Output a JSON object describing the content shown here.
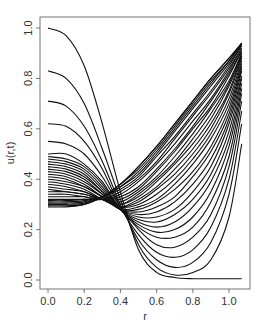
{
  "chart_data": {
    "type": "line",
    "title": "",
    "xlabel": "r",
    "ylabel": "u(r,t)",
    "xlim": [
      -0.04,
      1.12
    ],
    "ylim": [
      -0.04,
      1.04
    ],
    "x_ticks": [
      0.0,
      0.2,
      0.4,
      0.6,
      0.8,
      1.0
    ],
    "x_tick_labels": [
      "0.0",
      "0.2",
      "0.4",
      "0.6",
      "0.8",
      "1.0"
    ],
    "y_ticks": [
      0.0,
      0.2,
      0.4,
      0.6,
      0.8,
      1.0
    ],
    "y_tick_labels": [
      "0.0",
      "0.2",
      "0.4",
      "0.6",
      "0.8",
      "1.0"
    ],
    "grid": false,
    "legend": "none",
    "x": [
      0.0,
      0.1,
      0.2,
      0.3,
      0.4,
      0.5,
      0.6,
      0.7,
      0.8,
      0.9,
      1.0,
      1.07
    ],
    "series": [
      {
        "name": "t0",
        "values": [
          1.0,
          0.97,
          0.85,
          0.62,
          0.35,
          0.12,
          0.03,
          0.01,
          0.005,
          0.005,
          0.005,
          0.005
        ]
      },
      {
        "name": "t1",
        "values": [
          0.83,
          0.8,
          0.7,
          0.52,
          0.32,
          0.14,
          0.05,
          0.02,
          0.03,
          0.08,
          0.25,
          0.54
        ]
      },
      {
        "name": "t2",
        "values": [
          0.71,
          0.69,
          0.61,
          0.47,
          0.3,
          0.16,
          0.08,
          0.05,
          0.07,
          0.15,
          0.34,
          0.62
        ]
      },
      {
        "name": "t3",
        "values": [
          0.62,
          0.61,
          0.55,
          0.44,
          0.29,
          0.18,
          0.11,
          0.09,
          0.12,
          0.21,
          0.4,
          0.67
        ]
      },
      {
        "name": "t4",
        "values": [
          0.55,
          0.54,
          0.5,
          0.41,
          0.29,
          0.2,
          0.14,
          0.13,
          0.17,
          0.26,
          0.45,
          0.71
        ]
      },
      {
        "name": "t5",
        "values": [
          0.5,
          0.5,
          0.46,
          0.39,
          0.28,
          0.21,
          0.17,
          0.17,
          0.21,
          0.31,
          0.49,
          0.74
        ]
      },
      {
        "name": "t6",
        "values": [
          0.49,
          0.48,
          0.45,
          0.38,
          0.28,
          0.22,
          0.19,
          0.2,
          0.25,
          0.35,
          0.53,
          0.76
        ]
      },
      {
        "name": "t7",
        "values": [
          0.48,
          0.47,
          0.44,
          0.37,
          0.28,
          0.23,
          0.21,
          0.23,
          0.29,
          0.39,
          0.56,
          0.78
        ]
      },
      {
        "name": "t8",
        "values": [
          0.47,
          0.46,
          0.43,
          0.36,
          0.28,
          0.24,
          0.23,
          0.26,
          0.32,
          0.42,
          0.59,
          0.8
        ]
      },
      {
        "name": "t9",
        "values": [
          0.46,
          0.45,
          0.42,
          0.35,
          0.28,
          0.25,
          0.25,
          0.28,
          0.35,
          0.45,
          0.62,
          0.81
        ]
      },
      {
        "name": "t10",
        "values": [
          0.45,
          0.44,
          0.41,
          0.35,
          0.28,
          0.26,
          0.27,
          0.31,
          0.38,
          0.48,
          0.64,
          0.83
        ]
      },
      {
        "name": "t11",
        "values": [
          0.44,
          0.43,
          0.4,
          0.34,
          0.28,
          0.27,
          0.29,
          0.33,
          0.41,
          0.51,
          0.66,
          0.84
        ]
      },
      {
        "name": "t12",
        "values": [
          0.43,
          0.42,
          0.39,
          0.34,
          0.28,
          0.28,
          0.31,
          0.36,
          0.43,
          0.53,
          0.68,
          0.85
        ]
      },
      {
        "name": "t13",
        "values": [
          0.42,
          0.41,
          0.38,
          0.33,
          0.28,
          0.29,
          0.32,
          0.38,
          0.46,
          0.56,
          0.7,
          0.86
        ]
      },
      {
        "name": "t14",
        "values": [
          0.41,
          0.4,
          0.37,
          0.33,
          0.29,
          0.3,
          0.34,
          0.4,
          0.48,
          0.58,
          0.72,
          0.87
        ]
      },
      {
        "name": "t15",
        "values": [
          0.4,
          0.39,
          0.37,
          0.33,
          0.29,
          0.31,
          0.36,
          0.42,
          0.5,
          0.6,
          0.74,
          0.88
        ]
      },
      {
        "name": "t16",
        "values": [
          0.39,
          0.38,
          0.36,
          0.32,
          0.29,
          0.32,
          0.37,
          0.44,
          0.52,
          0.62,
          0.75,
          0.89
        ]
      },
      {
        "name": "t17",
        "values": [
          0.38,
          0.37,
          0.35,
          0.32,
          0.3,
          0.33,
          0.39,
          0.46,
          0.54,
          0.64,
          0.77,
          0.89
        ]
      },
      {
        "name": "t18",
        "values": [
          0.37,
          0.36,
          0.35,
          0.32,
          0.3,
          0.34,
          0.4,
          0.47,
          0.56,
          0.66,
          0.78,
          0.9
        ]
      },
      {
        "name": "t19",
        "values": [
          0.36,
          0.35,
          0.34,
          0.32,
          0.31,
          0.35,
          0.41,
          0.49,
          0.58,
          0.68,
          0.79,
          0.9
        ]
      },
      {
        "name": "t20",
        "values": [
          0.35,
          0.35,
          0.34,
          0.32,
          0.32,
          0.36,
          0.43,
          0.51,
          0.6,
          0.69,
          0.81,
          0.91
        ]
      },
      {
        "name": "t21",
        "values": [
          0.34,
          0.34,
          0.33,
          0.32,
          0.33,
          0.37,
          0.44,
          0.52,
          0.61,
          0.71,
          0.82,
          0.91
        ]
      },
      {
        "name": "t22",
        "values": [
          0.33,
          0.33,
          0.33,
          0.32,
          0.34,
          0.39,
          0.46,
          0.54,
          0.63,
          0.72,
          0.83,
          0.92
        ]
      },
      {
        "name": "t23",
        "values": [
          0.32,
          0.32,
          0.32,
          0.32,
          0.35,
          0.4,
          0.47,
          0.56,
          0.65,
          0.74,
          0.84,
          0.92
        ]
      },
      {
        "name": "t24",
        "values": [
          0.315,
          0.315,
          0.32,
          0.33,
          0.36,
          0.41,
          0.49,
          0.57,
          0.66,
          0.75,
          0.85,
          0.93
        ]
      },
      {
        "name": "t25",
        "values": [
          0.31,
          0.31,
          0.315,
          0.33,
          0.37,
          0.42,
          0.5,
          0.59,
          0.68,
          0.77,
          0.86,
          0.93
        ]
      },
      {
        "name": "t26",
        "values": [
          0.305,
          0.305,
          0.31,
          0.33,
          0.37,
          0.43,
          0.51,
          0.6,
          0.69,
          0.78,
          0.87,
          0.935
        ]
      },
      {
        "name": "t27",
        "values": [
          0.3,
          0.3,
          0.305,
          0.33,
          0.38,
          0.44,
          0.52,
          0.61,
          0.7,
          0.79,
          0.87,
          0.94
        ]
      },
      {
        "name": "t28",
        "values": [
          0.295,
          0.295,
          0.3,
          0.33,
          0.38,
          0.45,
          0.53,
          0.62,
          0.71,
          0.8,
          0.88,
          0.94
        ]
      },
      {
        "name": "t29",
        "values": [
          0.29,
          0.29,
          0.3,
          0.33,
          0.38,
          0.45,
          0.53,
          0.62,
          0.71,
          0.8,
          0.88,
          0.94
        ]
      }
    ]
  }
}
